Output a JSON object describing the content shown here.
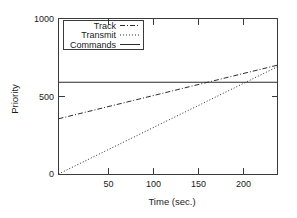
{
  "chart_data": {
    "type": "line",
    "title": "",
    "xlabel": "Time (sec.)",
    "ylabel": "Priority",
    "xlim": [
      5,
      239
    ],
    "ylim": [
      0,
      1000
    ],
    "xticks": [
      50,
      100,
      150,
      200
    ],
    "yticks": [
      0,
      500,
      1000
    ],
    "grid": false,
    "legend_position": "top-left-inside",
    "series": [
      {
        "name": "Track",
        "style": "dash-dot",
        "color": "#2b2b2b",
        "x": [
          5,
          239
        ],
        "values": [
          355,
          700
        ]
      },
      {
        "name": "Transmit",
        "style": "dotted",
        "color": "#2b2b2b",
        "x": [
          5,
          239
        ],
        "values": [
          0,
          690
        ]
      },
      {
        "name": "Commands",
        "style": "solid",
        "color": "#2b2b2b",
        "x": [
          5,
          239
        ],
        "values": [
          590,
          590
        ]
      }
    ]
  },
  "axes": {
    "y_tick_labels": [
      "1000",
      "500",
      "0"
    ],
    "x_tick_labels": [
      "50",
      "100",
      "150",
      "200"
    ],
    "y_title": "Priority",
    "x_title": "Time (sec.)"
  },
  "legend": {
    "entries": [
      {
        "label": "Track"
      },
      {
        "label": "Transmit"
      },
      {
        "label": "Commands"
      }
    ]
  }
}
